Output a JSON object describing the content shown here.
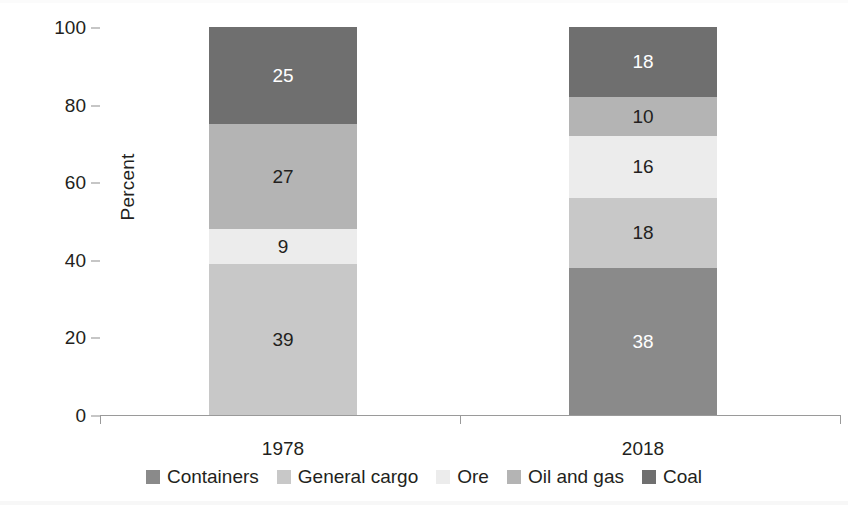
{
  "chart_data": {
    "type": "bar",
    "subtype": "stacked-100-percent",
    "title": "",
    "xlabel": "",
    "ylabel": "Percent",
    "ylim": [
      0,
      100
    ],
    "yticks": [
      0,
      20,
      40,
      60,
      80,
      100
    ],
    "grid": false,
    "legend_position": "bottom",
    "categories": [
      "1978",
      "2018"
    ],
    "series": [
      {
        "name": "Containers",
        "color": "#8a8a8a",
        "values": [
          0,
          38
        ],
        "label_color": "#ffffff"
      },
      {
        "name": "General cargo",
        "color": "#c8c8c8",
        "values": [
          39,
          18
        ],
        "label_color": "#231f20"
      },
      {
        "name": "Ore",
        "color": "#ececec",
        "values": [
          9,
          16
        ],
        "label_color": "#231f20"
      },
      {
        "name": "Oil and gas",
        "color": "#b4b4b4",
        "values": [
          27,
          10
        ],
        "label_color": "#231f20"
      },
      {
        "name": "Coal",
        "color": "#6f6f6f",
        "values": [
          25,
          18
        ],
        "label_color": "#ffffff"
      }
    ],
    "bar_value_labels": {
      "1978": [
        "",
        "39",
        "9",
        "27",
        "25"
      ],
      "2018": [
        "38",
        "18",
        "16",
        "10",
        "18"
      ]
    }
  },
  "axis": {
    "y_title": "Percent",
    "y_tick_labels": [
      "0",
      "20",
      "40",
      "60",
      "80",
      "100"
    ],
    "x_tick_labels": [
      "1978",
      "2018"
    ]
  },
  "legend": {
    "items": [
      {
        "label": "Containers",
        "color": "#8a8a8a"
      },
      {
        "label": "General cargo",
        "color": "#c8c8c8"
      },
      {
        "label": "Ore",
        "color": "#ececec"
      },
      {
        "label": "Oil and gas",
        "color": "#b4b4b4"
      },
      {
        "label": "Coal",
        "color": "#6f6f6f"
      }
    ]
  }
}
